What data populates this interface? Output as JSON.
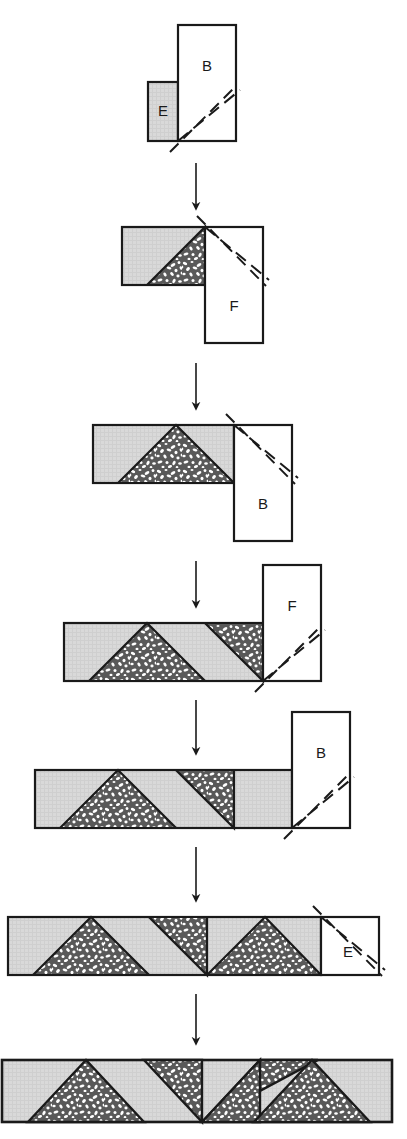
{
  "diagram": {
    "type": "process-flow",
    "orientation": "vertical",
    "colors": {
      "light_gray_fill": "#d6d6d6",
      "speckle_dark": "#595959",
      "speckle_light": "#ffffff",
      "outline": "#1a1a1a",
      "white_fill": "#ffffff",
      "arrow": "#1a1a1a"
    },
    "stages": [
      {
        "index": 1,
        "strip": {
          "x": 148,
          "y": 82,
          "w": 30,
          "h": 59,
          "fill": "light-gray"
        },
        "block": {
          "label": "E",
          "x": 148,
          "y": 82,
          "w": 30,
          "h": 59,
          "fill": "light-gray"
        },
        "attached_block": {
          "label": "B",
          "x": 178,
          "y": 25,
          "w": 58,
          "h": 116,
          "fill": "white"
        },
        "cut_lines": 2
      },
      {
        "index": 2,
        "strip": {
          "x": 122,
          "y": 227,
          "w": 83,
          "h": 58,
          "fill": "light-gray"
        },
        "attached_block": {
          "label": "F",
          "x": 205,
          "y": 227,
          "w": 58,
          "h": 116,
          "fill": "white"
        },
        "cut_lines": 2
      },
      {
        "index": 3,
        "strip": {
          "x": 93,
          "y": 425,
          "w": 141,
          "h": 58,
          "fill": "light-gray"
        },
        "attached_block": {
          "label": "B",
          "x": 234,
          "y": 425,
          "w": 58,
          "h": 116,
          "fill": "white"
        },
        "cut_lines": 2
      },
      {
        "index": 4,
        "strip": {
          "x": 64,
          "y": 623,
          "w": 199,
          "h": 58,
          "fill": "light-gray"
        },
        "attached_block": {
          "label": "F",
          "x": 263,
          "y": 565,
          "w": 58,
          "h": 116,
          "fill": "white"
        },
        "cut_lines": 2
      },
      {
        "index": 5,
        "strip": {
          "x": 35,
          "y": 770,
          "w": 257,
          "h": 58,
          "fill": "light-gray"
        },
        "attached_block": {
          "label": "B",
          "x": 292,
          "y": 712,
          "w": 58,
          "h": 116,
          "fill": "white"
        },
        "cut_lines": 2
      },
      {
        "index": 6,
        "strip": {
          "x": 8,
          "y": 917,
          "w": 313,
          "h": 58,
          "fill": "light-gray"
        },
        "attached_block": {
          "label": "E",
          "x": 321,
          "y": 917,
          "w": 58,
          "h": 58,
          "fill": "white"
        },
        "cut_lines": 2
      },
      {
        "index": 7,
        "strip": {
          "x": 2,
          "y": 1060,
          "w": 390,
          "h": 62,
          "fill": "light-gray"
        },
        "attached_block": null,
        "cut_lines": 0
      }
    ],
    "arrows": [
      {
        "index": 1,
        "x": 196,
        "y1": 163,
        "y2": 214
      },
      {
        "index": 2,
        "x": 196,
        "y1": 363,
        "y2": 414
      },
      {
        "index": 3,
        "x": 196,
        "y1": 561,
        "y2": 612
      },
      {
        "index": 4,
        "x": 196,
        "y1": 700,
        "y2": 759
      },
      {
        "index": 5,
        "x": 196,
        "y1": 847,
        "y2": 906
      },
      {
        "index": 6,
        "x": 196,
        "y1": 994,
        "y2": 1048
      }
    ],
    "labels": [
      "B",
      "E",
      "F",
      "B",
      "F",
      "B",
      "E"
    ]
  }
}
